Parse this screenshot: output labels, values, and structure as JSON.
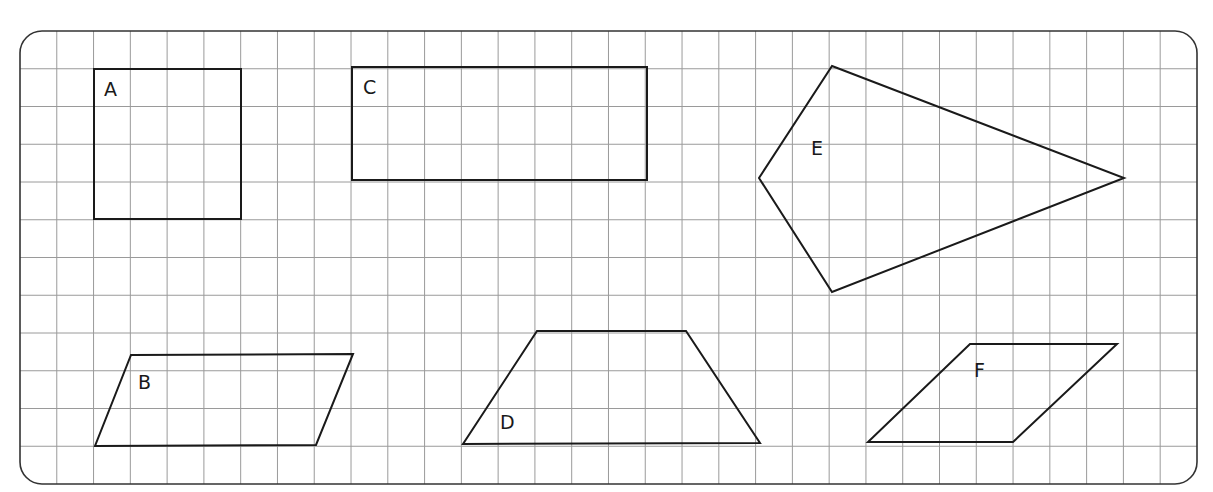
{
  "figure": {
    "frame": {
      "x": 20,
      "y": 31,
      "width": 1177,
      "height": 453,
      "radius": 22,
      "stroke": "#333333"
    },
    "grid": {
      "x0": 20,
      "y0": 31,
      "cols": 32,
      "rows": 12,
      "cell_w": 36.78,
      "cell_h": 37.75,
      "color": "#9a9a9a"
    },
    "shape_stroke": "#1a1a1a",
    "shapes": [
      {
        "id": "A",
        "label": "A",
        "type": "rectangle",
        "points": [
          [
            94,
            69
          ],
          [
            241,
            69
          ],
          [
            241,
            219
          ],
          [
            94,
            219
          ]
        ],
        "label_pos": [
          104,
          96
        ]
      },
      {
        "id": "B",
        "label": "B",
        "type": "parallelogram",
        "points": [
          [
            131,
            355
          ],
          [
            353,
            354
          ],
          [
            316,
            445
          ],
          [
            95,
            446
          ]
        ],
        "label_pos": [
          138,
          389
        ]
      },
      {
        "id": "C",
        "label": "C",
        "type": "rectangle",
        "points": [
          [
            352,
            67
          ],
          [
            647,
            67
          ],
          [
            647,
            180
          ],
          [
            352,
            180
          ]
        ],
        "label_pos": [
          363,
          94
        ]
      },
      {
        "id": "D",
        "label": "D",
        "type": "trapezium",
        "points": [
          [
            537,
            331
          ],
          [
            686,
            331
          ],
          [
            760,
            443
          ],
          [
            463,
            444
          ]
        ],
        "label_pos": [
          500,
          429
        ]
      },
      {
        "id": "E",
        "label": "E",
        "type": "kite",
        "points": [
          [
            832,
            66
          ],
          [
            1124,
            178
          ],
          [
            832,
            292
          ],
          [
            759,
            178
          ]
        ],
        "label_pos": [
          811,
          155
        ]
      },
      {
        "id": "F",
        "label": "F",
        "type": "parallelogram",
        "points": [
          [
            970,
            344
          ],
          [
            1117,
            344
          ],
          [
            1013,
            442
          ],
          [
            868,
            442
          ]
        ],
        "label_pos": [
          974,
          377
        ]
      }
    ]
  }
}
